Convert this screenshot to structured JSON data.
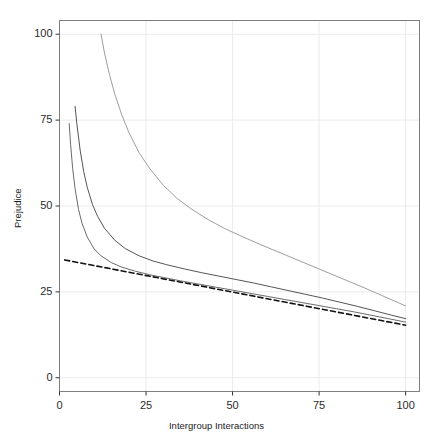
{
  "chart_data": {
    "type": "line",
    "title": "",
    "xlabel": "Intergroup Interactions",
    "ylabel": "Prejudice",
    "xlim": [
      0,
      104
    ],
    "ylim": [
      -4,
      104
    ],
    "xticks": [
      0,
      25,
      50,
      75,
      100
    ],
    "xtick_labels": [
      "0",
      "25",
      "50",
      "75",
      "100"
    ],
    "yticks": [
      0,
      25,
      50,
      75,
      100
    ],
    "ytick_labels": [
      "0",
      "25",
      "50",
      "75",
      "100"
    ],
    "grid": true,
    "legend": "none",
    "panel_background": "#ffffff",
    "grid_color": "#ebebeb",
    "panel_border_color": "#7f7f7f",
    "series": [
      {
        "name": "curve-1",
        "style": "solid",
        "color": "#6b6b6b",
        "width": 1.0,
        "x": [
          2.8,
          3.2,
          3.8,
          4.5,
          5.5,
          6.5,
          8,
          10,
          12,
          15,
          18,
          22,
          26,
          30,
          35,
          40,
          45,
          50,
          55,
          60,
          65,
          70,
          75,
          80,
          85,
          90,
          95,
          100
        ],
        "y": [
          74.0,
          68.0,
          61.0,
          55.0,
          49.0,
          45.0,
          41.0,
          37.5,
          35.5,
          33.5,
          32.2,
          31.0,
          30.0,
          29.2,
          28.2,
          27.3,
          26.4,
          25.5,
          24.6,
          23.7,
          22.8,
          21.9,
          21.0,
          20.1,
          19.2,
          18.2,
          17.2,
          16.2
        ]
      },
      {
        "name": "curve-2",
        "style": "solid",
        "color": "#555555",
        "width": 1.0,
        "x": [
          4.5,
          5,
          6,
          7,
          8,
          9.5,
          11,
          13,
          16,
          19,
          23,
          27,
          31,
          36,
          41,
          46,
          51,
          56,
          61,
          66,
          71,
          76,
          81,
          86,
          91,
          96,
          100
        ],
        "y": [
          79.0,
          74.0,
          66.0,
          60.0,
          55.5,
          50.5,
          47.0,
          43.5,
          40.0,
          37.6,
          35.5,
          34.0,
          32.9,
          31.7,
          30.6,
          29.6,
          28.6,
          27.6,
          26.5,
          25.4,
          24.3,
          23.2,
          22.0,
          20.8,
          19.5,
          18.2,
          17.2
        ]
      },
      {
        "name": "curve-3",
        "style": "solid",
        "color": "#9e9e9e",
        "width": 1.0,
        "x": [
          12,
          13,
          14.5,
          16,
          18,
          20,
          23,
          26,
          30,
          34,
          38,
          43,
          48,
          53,
          58,
          63,
          68,
          73,
          78,
          83,
          88,
          93,
          98,
          100
        ],
        "y": [
          100.0,
          94.5,
          88.0,
          82.5,
          76.5,
          71.5,
          65.5,
          61.0,
          56.0,
          52.2,
          49.2,
          46.0,
          43.3,
          41.0,
          38.8,
          36.7,
          34.6,
          32.5,
          30.4,
          28.3,
          26.2,
          24.0,
          21.8,
          20.9
        ]
      },
      {
        "name": "dashed-line",
        "style": "dashed",
        "color": "#111111",
        "width": 1.6,
        "x": [
          1.5,
          100
        ],
        "y": [
          34.3,
          15.3
        ]
      }
    ]
  },
  "axis": {
    "x_title": "Intergroup Interactions",
    "y_title": "Prejudice"
  }
}
